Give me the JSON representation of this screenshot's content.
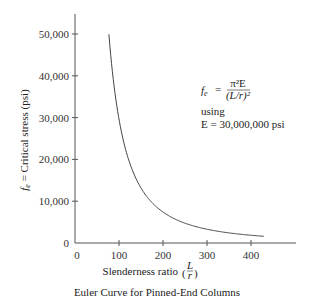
{
  "chart_data": {
    "type": "line",
    "title": "Euler Curve for Pinned-End Columns",
    "xlabel": "Slenderness ratio (L/r)",
    "ylabel": "f_e = Critical stress (psi)",
    "xlim": [
      0,
      500
    ],
    "ylim": [
      0,
      55000
    ],
    "grid": false,
    "legend": null,
    "x_ticks": [
      0,
      100,
      200,
      300,
      400
    ],
    "x_tick_labels": [
      "0",
      "100",
      "200",
      "300",
      "400"
    ],
    "y_ticks": [
      0,
      10000,
      20000,
      30000,
      40000,
      50000
    ],
    "y_tick_labels": [
      "0",
      "10,000",
      "20,000",
      "30,000",
      "40,000",
      "50,000"
    ],
    "series": [
      {
        "name": "Euler curve",
        "formula": "f_e = pi^2 E / (L/r)^2, E = 30,000,000 psi",
        "x": [
          77,
          80,
          90,
          100,
          110,
          120,
          140,
          160,
          180,
          200,
          225,
          250,
          275,
          300,
          350,
          400,
          430
        ],
        "values": [
          49940,
          46260,
          36550,
          29610,
          24470,
          20560,
          15110,
          11570,
          9140,
          7400,
          5850,
          4740,
          3920,
          3290,
          2420,
          1850,
          1600
        ]
      }
    ],
    "annotations": [
      {
        "text": "f_e = π²E / (L/r)²",
        "position": "upper right"
      },
      {
        "text": "using",
        "position": "upper right"
      },
      {
        "text": "E = 30,000,000 psi",
        "position": "upper right"
      }
    ]
  },
  "labels": {
    "ylabel_prefix": "f",
    "ylabel_sub": "e",
    "ylabel_rest": " = Critical stress (psi)",
    "xlabel_text": "Slenderness ratio",
    "xlabel_frac_num": "L",
    "xlabel_frac_den": "r",
    "formula_lhs": "f",
    "formula_lhs_sub": "e",
    "formula_eq": "=",
    "formula_num": "π²E",
    "formula_den": "(L/r)²",
    "using": "using",
    "e_value": "E = 30,000,000 psi",
    "caption": "Euler Curve for Pinned-End Columns"
  },
  "colors": {
    "axis": "#555555",
    "curve": "#444444",
    "text": "#222222"
  }
}
